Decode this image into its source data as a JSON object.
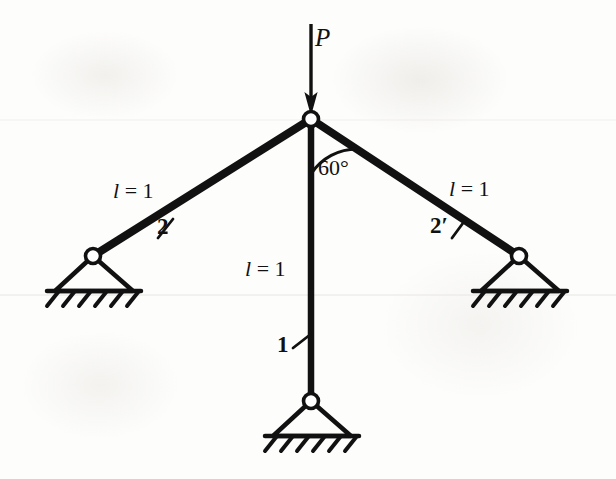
{
  "figure": {
    "background_color": "#fdfdfc",
    "ink_color": "#111111"
  },
  "load": {
    "symbol": "P",
    "direction": "downward",
    "applied_at": "top-joint"
  },
  "angle": {
    "value": "60°",
    "between": "vertical-member-and-right-diagonal"
  },
  "members": [
    {
      "id": "left-diagonal",
      "number_label": "2",
      "length_label_prefix": "l",
      "length_label_eq": "=",
      "length_label_value": "1"
    },
    {
      "id": "vertical",
      "number_label": "1",
      "length_label_prefix": "l",
      "length_label_eq": "=",
      "length_label_value": "1"
    },
    {
      "id": "right-diagonal",
      "number_label": "2′",
      "length_label_prefix": "l",
      "length_label_eq": "=",
      "length_label_value": "1"
    }
  ],
  "supports": [
    {
      "id": "left-support",
      "type": "pinned"
    },
    {
      "id": "right-support",
      "type": "pinned"
    },
    {
      "id": "bottom-support",
      "type": "pinned"
    }
  ],
  "joints": [
    {
      "id": "top-joint",
      "type": "pin"
    },
    {
      "id": "left-joint",
      "type": "pin"
    },
    {
      "id": "right-joint",
      "type": "pin"
    },
    {
      "id": "bottom-joint",
      "type": "pin"
    }
  ]
}
